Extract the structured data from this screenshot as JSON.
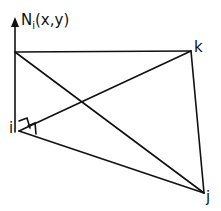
{
  "diagram": {
    "axis_label": {
      "base": "N",
      "subscript": "i",
      "args": "(x,y)"
    },
    "vertices": {
      "i": "i",
      "j": "j",
      "k": "k"
    }
  }
}
